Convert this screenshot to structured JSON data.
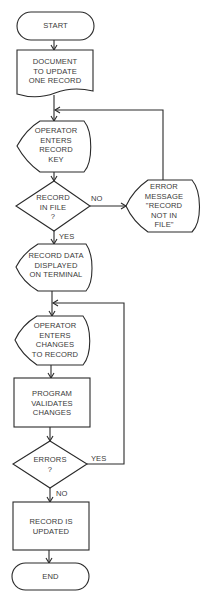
{
  "diagram": {
    "type": "flowchart",
    "nodes": [
      {
        "id": "start",
        "shape": "terminator",
        "label": "START"
      },
      {
        "id": "document",
        "shape": "document",
        "label": "DOCUMENT\nTO UPDATE\nONE RECORD"
      },
      {
        "id": "enter-key",
        "shape": "display",
        "label": "OPERATOR\nENTERS\nRECORD\nKEY"
      },
      {
        "id": "in-file",
        "shape": "decision",
        "label": "RECORD\nIN FILE\n?"
      },
      {
        "id": "error-msg",
        "shape": "display",
        "label": "ERROR\nMESSAGE\n\"RECORD\nNOT IN\nFILE\""
      },
      {
        "id": "data-displayed",
        "shape": "display",
        "label": "RECORD DATA\nDISPLAYED\nON TERMINAL"
      },
      {
        "id": "enter-changes",
        "shape": "display",
        "label": "OPERATOR\nENTERS\nCHANGES\nTO RECORD"
      },
      {
        "id": "validates",
        "shape": "process",
        "label": "PROGRAM\nVALIDATES\nCHANGES"
      },
      {
        "id": "errors",
        "shape": "decision",
        "label": "ERRORS\n?"
      },
      {
        "id": "updated",
        "shape": "process",
        "label": "RECORD IS\nUPDATED"
      },
      {
        "id": "end",
        "shape": "terminator",
        "label": "END"
      }
    ],
    "edges": [
      {
        "from": "start",
        "to": "document",
        "label": ""
      },
      {
        "from": "document",
        "to": "enter-key",
        "label": ""
      },
      {
        "from": "enter-key",
        "to": "in-file",
        "label": ""
      },
      {
        "from": "in-file",
        "to": "error-msg",
        "label": "NO"
      },
      {
        "from": "error-msg",
        "to": "enter-key",
        "label": ""
      },
      {
        "from": "in-file",
        "to": "data-displayed",
        "label": "YES"
      },
      {
        "from": "data-displayed",
        "to": "enter-changes",
        "label": ""
      },
      {
        "from": "enter-changes",
        "to": "validates",
        "label": ""
      },
      {
        "from": "validates",
        "to": "errors",
        "label": ""
      },
      {
        "from": "errors",
        "to": "enter-changes",
        "label": "YES"
      },
      {
        "from": "errors",
        "to": "updated",
        "label": "NO"
      },
      {
        "from": "updated",
        "to": "end",
        "label": ""
      }
    ]
  },
  "labels": {
    "start": "START",
    "document": "DOCUMENT\nTO UPDATE\nONE RECORD",
    "enter_key": "OPERATOR\nENTERS\nRECORD\nKEY",
    "in_file": "RECORD\nIN FILE\n?",
    "error_msg": "ERROR\nMESSAGE\n\"RECORD\nNOT IN\nFILE\"",
    "data_displayed": "RECORD DATA\nDISPLAYED\nON TERMINAL",
    "enter_changes": "OPERATOR\nENTERS\nCHANGES\nTO RECORD",
    "validates": "PROGRAM\nVALIDATES\nCHANGES",
    "errors": "ERRORS\n?",
    "updated": "RECORD IS\nUPDATED",
    "end": "END",
    "edge_no_1": "NO",
    "edge_yes_1": "YES",
    "edge_yes_2": "YES",
    "edge_no_2": "NO"
  }
}
